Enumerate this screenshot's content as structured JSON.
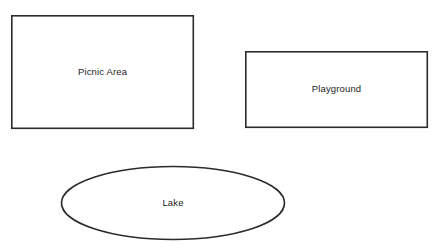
{
  "canvas": {
    "width": 437,
    "height": 252,
    "background_color": "#ffffff",
    "stroke_color": "#2b2b2b",
    "text_color": "#1c1c1c"
  },
  "diagram": {
    "shapes": [
      {
        "id": "picnic-area",
        "type": "rectangle",
        "label": "Picnic Area",
        "x": 11,
        "y": 15,
        "width": 183,
        "height": 114,
        "stroke": "#2b2b2b",
        "stroke_width": 1.6,
        "fill": "#ffffff"
      },
      {
        "id": "playground",
        "type": "rectangle",
        "label": "Playground",
        "x": 245,
        "y": 51,
        "width": 183,
        "height": 77,
        "stroke": "#2b2b2b",
        "stroke_width": 1.6,
        "fill": "#ffffff"
      },
      {
        "id": "lake",
        "type": "ellipse",
        "label": "Lake",
        "cx": 173,
        "cy": 203,
        "rx": 112,
        "ry": 37,
        "stroke": "#2b2b2b",
        "stroke_width": 1.6,
        "fill": "#ffffff"
      }
    ]
  }
}
